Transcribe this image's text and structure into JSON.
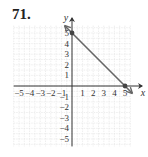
{
  "problem": {
    "number": "71."
  },
  "chart_data": {
    "type": "line",
    "title": "",
    "xlabel": "x",
    "ylabel": "y",
    "xlim": [
      -5,
      5
    ],
    "ylim": [
      -5,
      5
    ],
    "grid": true,
    "x_ticks": [
      "-5",
      "-4",
      "-3",
      "-2",
      "-1",
      "1",
      "2",
      "3",
      "4",
      "5"
    ],
    "y_ticks": [
      "5",
      "4",
      "3",
      "2",
      "1",
      "-1",
      "-2",
      "-3",
      "-4",
      "-5"
    ],
    "series": [
      {
        "name": "y = -x + 5",
        "points": [
          [
            0,
            5
          ],
          [
            5,
            0
          ]
        ],
        "arrows_both_ends": true,
        "color": "#666666"
      }
    ],
    "marked_points": [
      [
        0,
        5
      ],
      [
        5,
        0
      ]
    ]
  }
}
